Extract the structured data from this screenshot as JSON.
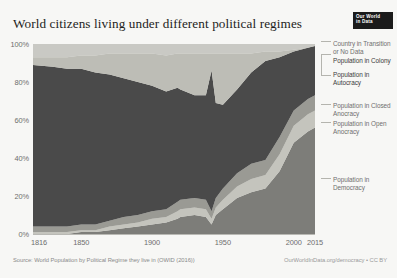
{
  "header": {
    "title": "World citizens living under different political regimes",
    "logo_line1": "Our World",
    "logo_line2": "in Data"
  },
  "footer": {
    "source": "Source: World Population by Political Regime they live in (OWID (2016))",
    "credit": "OurWorldInData.org/democracy • CC BY"
  },
  "legend": {
    "items": [
      {
        "label": "Country in Transition or No Data",
        "color": "#c9c9c4"
      },
      {
        "label": "Population in Colony",
        "color": "#bdbdb6"
      },
      {
        "label": "Population in Autocracy",
        "color": "#4a4a4a"
      },
      {
        "label": "Population in Closed Anocracy",
        "color": "#9a9a94"
      },
      {
        "label": "Population in Open Anocracy",
        "color": "#c4c4bd"
      },
      {
        "label": "Population in Democracy",
        "color": "#7d7d79"
      }
    ]
  },
  "chart_data": {
    "type": "area",
    "stacked": true,
    "title": "World citizens living under different political regimes",
    "xlabel": "",
    "ylabel": "",
    "xlim": [
      1816,
      2015
    ],
    "ylim": [
      0,
      100
    ],
    "grid": false,
    "legend_position": "right",
    "xticks": [
      "1816",
      "1850",
      "1900",
      "1950",
      "2000",
      "2015"
    ],
    "xtick_values": [
      1816,
      1850,
      1900,
      1950,
      2000,
      2015
    ],
    "yticks": [
      "0%",
      "20%",
      "40%",
      "60%",
      "80%",
      "100%"
    ],
    "ytick_values": [
      0,
      20,
      40,
      60,
      80,
      100
    ],
    "x": [
      1816,
      1830,
      1840,
      1850,
      1860,
      1870,
      1880,
      1890,
      1900,
      1910,
      1918,
      1920,
      1930,
      1938,
      1942,
      1945,
      1950,
      1960,
      1970,
      1980,
      1990,
      2000,
      2010,
      2015
    ],
    "series": [
      {
        "name": "Population in Democracy",
        "color": "#7d7d79",
        "values": [
          0,
          0,
          0,
          1,
          1,
          2,
          3,
          4,
          5,
          6,
          8,
          9,
          10,
          9,
          5,
          10,
          13,
          19,
          22,
          24,
          33,
          48,
          54,
          56
        ]
      },
      {
        "name": "Population in Open Anocracy",
        "color": "#c4c4bd",
        "values": [
          1,
          1,
          1,
          1,
          1,
          2,
          2,
          2,
          3,
          3,
          4,
          4,
          4,
          4,
          3,
          4,
          5,
          6,
          7,
          7,
          9,
          9,
          9,
          9
        ]
      },
      {
        "name": "Population in Closed Anocracy",
        "color": "#9a9a94",
        "values": [
          3,
          3,
          3,
          3,
          3,
          3,
          4,
          4,
          4,
          4,
          5,
          5,
          5,
          5,
          4,
          5,
          6,
          7,
          8,
          8,
          9,
          8,
          8,
          8
        ]
      },
      {
        "name": "Population in Autocracy",
        "color": "#4a4a4a",
        "values": [
          85,
          84,
          83,
          82,
          80,
          77,
          73,
          70,
          66,
          62,
          60,
          58,
          54,
          55,
          74,
          50,
          44,
          44,
          48,
          52,
          42,
          31,
          27,
          26
        ]
      },
      {
        "name": "Population in Colony",
        "color": "#bdbdb6",
        "values": [
          4,
          5,
          6,
          7,
          9,
          11,
          13,
          15,
          17,
          19,
          18,
          19,
          22,
          22,
          9,
          26,
          27,
          19,
          10,
          5,
          3,
          1,
          0,
          0
        ]
      },
      {
        "name": "Country in Transition or No Data",
        "color": "#c9c9c4",
        "values": [
          7,
          7,
          7,
          6,
          6,
          5,
          5,
          5,
          5,
          6,
          5,
          5,
          5,
          5,
          5,
          5,
          5,
          5,
          5,
          4,
          4,
          3,
          2,
          1
        ]
      }
    ]
  }
}
